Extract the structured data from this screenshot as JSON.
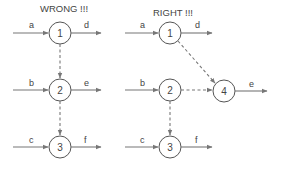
{
  "diagrams": [
    {
      "title": "WRONG !!!",
      "nodes": [
        "1",
        "2",
        "3"
      ],
      "activities": {
        "a": "a",
        "b": "b",
        "c": "c",
        "d": "d",
        "e": "e",
        "f": "f"
      }
    },
    {
      "title": "RIGHT !!!",
      "nodes": [
        "1",
        "2",
        "3",
        "4"
      ],
      "activities": {
        "a": "a",
        "b": "b",
        "c": "c",
        "d": "d",
        "e": "e",
        "f": "f"
      }
    }
  ]
}
